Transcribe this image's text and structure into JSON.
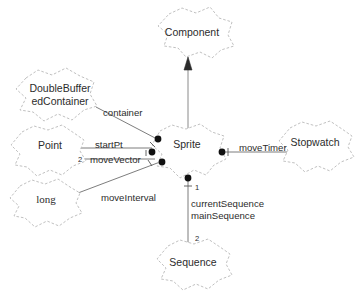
{
  "diagram": {
    "background_color": "#ffffff",
    "line_color": "#6e6e6e",
    "cloud_stroke_color": "#b9b9b9",
    "text_color": "#2c2c2c",
    "nodes": [
      {
        "id": "component",
        "label": "Component",
        "x": 192,
        "y": 33
      },
      {
        "id": "sprite",
        "label": "Sprite",
        "x": 187,
        "y": 145
      },
      {
        "id": "dbuf_1",
        "label": "DoubleBuffer",
        "x": 60,
        "y": 89
      },
      {
        "id": "dbuf_2",
        "label": "edContainer",
        "x": 60,
        "y": 102
      },
      {
        "id": "point",
        "label": "Point",
        "x": 50,
        "y": 146
      },
      {
        "id": "long",
        "label": "long",
        "x": 46,
        "y": 200
      },
      {
        "id": "stopwatch",
        "label": "Stopwatch",
        "x": 315,
        "y": 143
      },
      {
        "id": "sequence",
        "label": "Sequence",
        "x": 193,
        "y": 263
      }
    ],
    "edges": [
      {
        "id": "generalization",
        "from": "sprite",
        "to": "component",
        "label": "",
        "kind": "generalization"
      },
      {
        "id": "container",
        "from": "dbuf",
        "to": "sprite",
        "label": "container",
        "kind": "composition"
      },
      {
        "id": "startPt",
        "from": "point",
        "to": "sprite",
        "label": "startPt",
        "kind": "composition"
      },
      {
        "id": "moveVector",
        "from": "point",
        "to": "sprite",
        "label": "moveVector",
        "kind": "composition"
      },
      {
        "id": "moveInterval",
        "from": "long",
        "to": "sprite",
        "label": "moveInterval",
        "kind": "composition"
      },
      {
        "id": "moveTimer",
        "from": "sprite",
        "to": "stopwatch",
        "label": "moveTimer",
        "kind": "composition"
      },
      {
        "id": "currentSequence",
        "from": "sprite",
        "to": "sequence",
        "label": "currentSequence",
        "kind": "composition"
      },
      {
        "id": "mainSequence",
        "from": "sprite",
        "to": "sequence",
        "label": "mainSequence",
        "kind": "composition"
      }
    ],
    "multiplicities": [
      {
        "id": "mult-movevector",
        "value": "2",
        "x": 80,
        "y": 160
      },
      {
        "id": "mult-sprite-seq",
        "value": "1",
        "x": 195,
        "y": 188
      },
      {
        "id": "mult-sequence",
        "value": "2",
        "x": 195,
        "y": 239
      }
    ]
  }
}
